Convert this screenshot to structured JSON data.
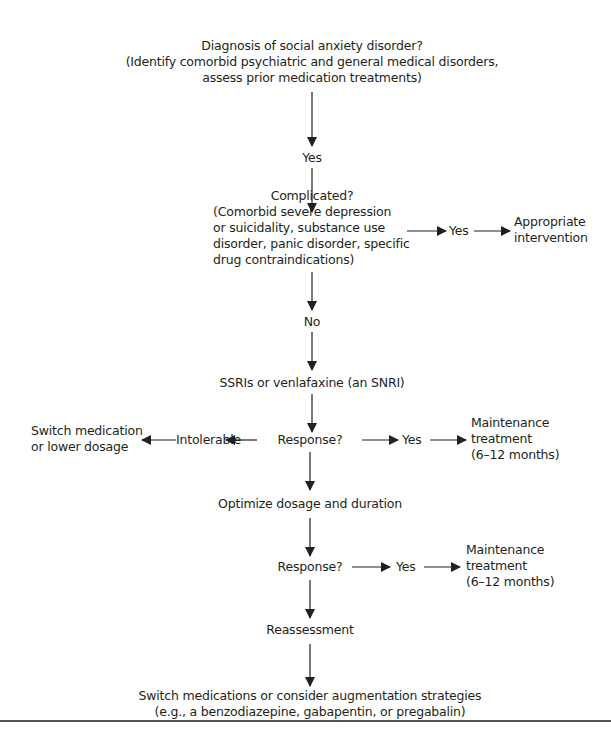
{
  "diagram": {
    "nodes": {
      "diagnosis": {
        "line1": "Diagnosis of social anxiety disorder?",
        "line2": "(Identify comorbid psychiatric and general medical disorders,",
        "line3": "assess prior medication treatments)"
      },
      "yes1": "Yes",
      "complicated": {
        "line1": "Complicated?",
        "line2": "(Comorbid severe depression",
        "line3": "or suicidality, substance use",
        "line4": "disorder, panic disorder, specific",
        "line5": "drug contraindications)"
      },
      "yes_complicated": "Yes",
      "appropriate_intervention": {
        "line1": "Appropriate",
        "line2": "intervention"
      },
      "no": "No",
      "ssri": "SSRIs or venlafaxine (an SNRI)",
      "response1": "Response?",
      "intolerable": "Intolerable",
      "switch_or_lower": {
        "line1": "Switch medication",
        "line2": "or lower dosage"
      },
      "yes_response1": "Yes",
      "maintenance1": {
        "line1": "Maintenance",
        "line2": "treatment",
        "line3": "(6–12 months)"
      },
      "optimize": "Optimize dosage and duration",
      "response2": "Response?",
      "yes_response2": "Yes",
      "maintenance2": {
        "line1": "Maintenance",
        "line2": "treatment",
        "line3": "(6–12 months)"
      },
      "reassessment": "Reassessment",
      "final": {
        "line1": "Switch medications or consider augmentation strategies",
        "line2": "(e.g., a benzodiazepine, gabapentin, or pregabalin)"
      }
    },
    "edges": [
      {
        "from": "diagnosis",
        "to": "yes1"
      },
      {
        "from": "yes1",
        "to": "complicated"
      },
      {
        "from": "complicated",
        "to": "yes_complicated"
      },
      {
        "from": "yes_complicated",
        "to": "appropriate_intervention"
      },
      {
        "from": "complicated",
        "to": "no"
      },
      {
        "from": "no",
        "to": "ssri"
      },
      {
        "from": "ssri",
        "to": "response1"
      },
      {
        "from": "response1",
        "to": "intolerable"
      },
      {
        "from": "intolerable",
        "to": "switch_or_lower"
      },
      {
        "from": "response1",
        "to": "yes_response1"
      },
      {
        "from": "yes_response1",
        "to": "maintenance1"
      },
      {
        "from": "response1",
        "to": "optimize"
      },
      {
        "from": "optimize",
        "to": "response2"
      },
      {
        "from": "response2",
        "to": "yes_response2"
      },
      {
        "from": "yes_response2",
        "to": "maintenance2"
      },
      {
        "from": "response2",
        "to": "reassessment"
      },
      {
        "from": "reassessment",
        "to": "final"
      }
    ]
  }
}
